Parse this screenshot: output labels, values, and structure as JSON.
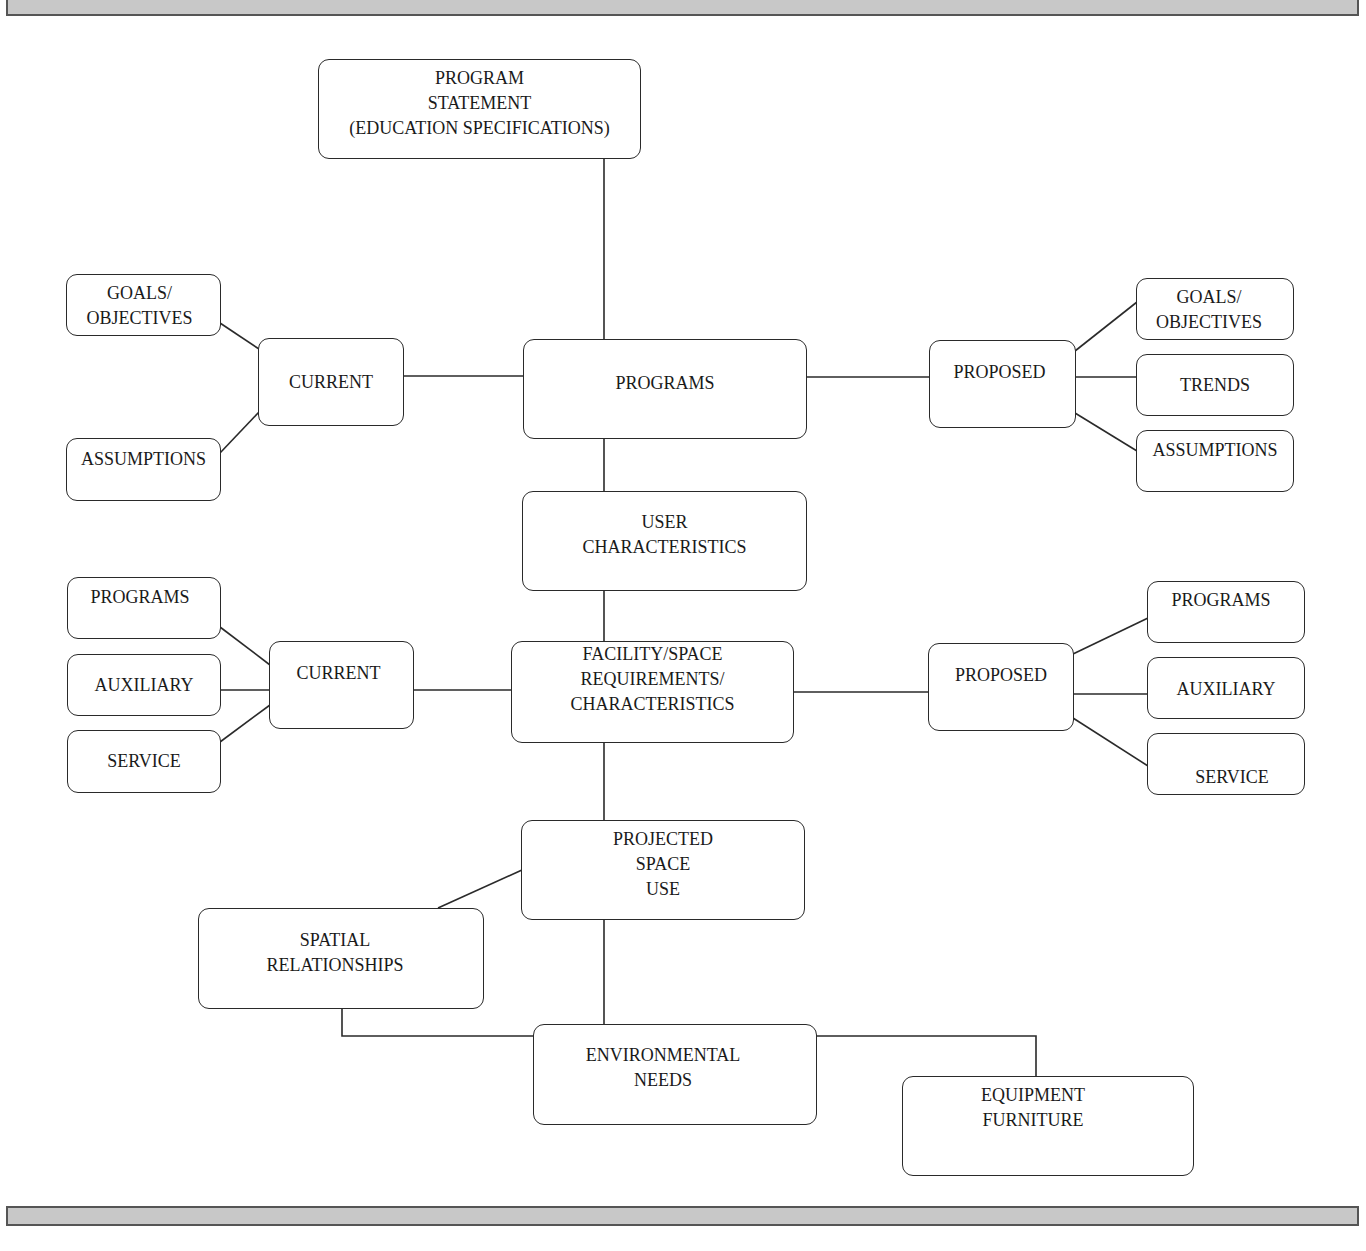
{
  "header_bar": {
    "color": "#c8c8c8"
  },
  "footer_bar": {
    "color": "#c8c8c8"
  },
  "nodes": {
    "program_statement": {
      "label": "PROGRAM\nSTATEMENT\n(EDUCATION SPECIFICATIONS)"
    },
    "programs": {
      "label": "PROGRAMS"
    },
    "programs_current": {
      "label": "CURRENT"
    },
    "programs_current_goals": {
      "label": "GOALS/\nOBJECTIVES"
    },
    "programs_current_assumptions": {
      "label": "ASSUMPTIONS"
    },
    "programs_proposed": {
      "label": "PROPOSED"
    },
    "programs_proposed_goals": {
      "label": "GOALS/\nOBJECTIVES"
    },
    "programs_proposed_trends": {
      "label": "TRENDS"
    },
    "programs_proposed_assumptions": {
      "label": "ASSUMPTIONS"
    },
    "user_characteristics": {
      "label": "USER\nCHARACTERISTICS"
    },
    "facility_space": {
      "label": "FACILITY/SPACE\nREQUIREMENTS/\nCHARACTERISTICS"
    },
    "facility_current": {
      "label": "CURRENT"
    },
    "facility_current_programs": {
      "label": "PROGRAMS"
    },
    "facility_current_auxiliary": {
      "label": "AUXILIARY"
    },
    "facility_current_service": {
      "label": "SERVICE"
    },
    "facility_proposed": {
      "label": "PROPOSED"
    },
    "facility_proposed_programs": {
      "label": "PROGRAMS"
    },
    "facility_proposed_auxiliary": {
      "label": "AUXILIARY"
    },
    "facility_proposed_service": {
      "label": "SERVICE"
    },
    "projected_space_use": {
      "label": "PROJECTED\nSPACE\nUSE"
    },
    "spatial_relationships": {
      "label": "SPATIAL\nRELATIONSHIPS"
    },
    "environmental_needs": {
      "label": "ENVIRONMENTAL\nNEEDS"
    },
    "equipment_furniture": {
      "label": "EQUIPMENT\nFURNITURE"
    }
  }
}
